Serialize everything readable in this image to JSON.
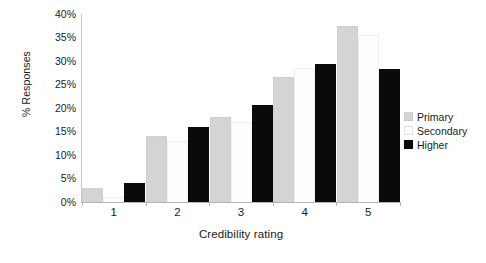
{
  "chart_data": {
    "type": "bar",
    "title": "",
    "subtitle": "",
    "xlabel": "Credibility rating",
    "ylabel": "% Responses",
    "categories": [
      "1",
      "2",
      "3",
      "4",
      "5"
    ],
    "series": [
      {
        "name": "Primary",
        "color": "#d4d4d4",
        "values": [
          3.0,
          14.0,
          18.0,
          26.5,
          37.5
        ]
      },
      {
        "name": "Secondary",
        "color": "#ffffff",
        "values": [
          1.0,
          13.0,
          17.0,
          28.5,
          35.5
        ]
      },
      {
        "name": "Higher",
        "color": "#0a0a0a",
        "values": [
          4.0,
          16.0,
          20.7,
          29.3,
          28.3
        ]
      }
    ],
    "ylim": [
      0,
      40
    ],
    "ytick_step": 5,
    "ytick_labels": [
      "40%",
      "35%",
      "30%",
      "25%",
      "20%",
      "15%",
      "10%",
      "5%",
      "0%"
    ],
    "ytick_values": [
      40,
      35,
      30,
      25,
      20,
      15,
      10,
      5,
      0
    ],
    "grid": false,
    "legend_position": "right",
    "legend_entries": [
      "Primary",
      "Secondary",
      "Higher"
    ]
  }
}
